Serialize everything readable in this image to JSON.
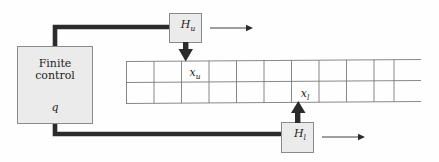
{
  "figure": {
    "type": "two-head-turing-machine-diagram",
    "background_color": "#fefefe",
    "ink_color": "#1d1d1d",
    "box_fill_color": "#ebebeb",
    "box_stroke_color": "#8a8a8a",
    "grid_line_color": "#7a7a7a",
    "thick_line_color": "#2b2b2b"
  },
  "finite_control": {
    "line1": "Finite",
    "line2": "control",
    "state": "q"
  },
  "heads": {
    "upper": {
      "label_base": "H",
      "label_sub": "u",
      "motion_arrow": "right-arrow-icon"
    },
    "lower": {
      "label_base": "H",
      "label_sub": "l",
      "motion_arrow": "right-arrow-icon"
    }
  },
  "tape": {
    "rows": 2,
    "visible_columns": 11,
    "upper_cell_label_base": "x",
    "upper_cell_label_sub": "u",
    "lower_cell_label_base": "x",
    "lower_cell_label_sub": "l"
  },
  "connectors": {
    "upper_link": "control-to-upper-head-link",
    "lower_link": "control-to-lower-head-link",
    "upper_head_to_tape": "down-arrow-icon",
    "lower_head_to_tape": "up-arrow-icon"
  }
}
